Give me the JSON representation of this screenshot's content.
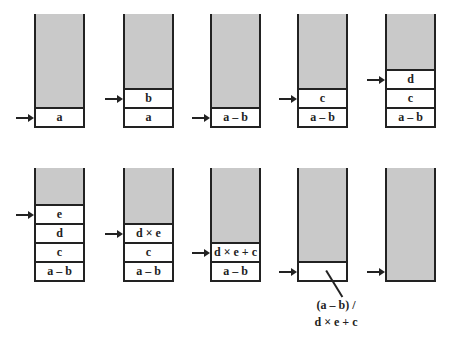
{
  "diagram": {
    "colors": {
      "stack_fill": "#c9c9c9",
      "cell_fill": "#ffffff",
      "stroke": "#222222"
    },
    "stacks": [
      {
        "row": 0,
        "col": 0,
        "cells": [
          "a"
        ]
      },
      {
        "row": 0,
        "col": 1,
        "cells": [
          "b",
          "a"
        ]
      },
      {
        "row": 0,
        "col": 2,
        "cells": [
          "a – b"
        ]
      },
      {
        "row": 0,
        "col": 3,
        "cells": [
          "c",
          "a – b"
        ]
      },
      {
        "row": 0,
        "col": 4,
        "cells": [
          "d",
          "c",
          "a – b"
        ]
      },
      {
        "row": 1,
        "col": 0,
        "cells": [
          "e",
          "d",
          "c",
          "a – b"
        ]
      },
      {
        "row": 1,
        "col": 1,
        "cells": [
          "d × e",
          "c",
          "a – b"
        ]
      },
      {
        "row": 1,
        "col": 2,
        "cells": [
          "d × e + c",
          "a – b"
        ]
      },
      {
        "row": 1,
        "col": 3,
        "cells": [
          ""
        ]
      },
      {
        "row": 1,
        "col": 4,
        "cells": []
      }
    ],
    "result_label": {
      "line1": "(a – b) /",
      "line2": "d × e + c"
    }
  }
}
